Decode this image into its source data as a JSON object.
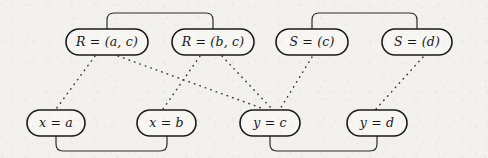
{
  "figure": {
    "kind": "constraint-graph-diagram",
    "background_color": "#f2f1ed",
    "ink_color": "#1a1a1c",
    "width": 488,
    "height": 158
  },
  "nodes": {
    "top_row": [
      {
        "id": "r-ac",
        "label": "R = (a, c)",
        "x": 66,
        "y": 29,
        "w": 82,
        "h": 26
      },
      {
        "id": "r-bc",
        "label": "R = (b, c)",
        "x": 172,
        "y": 29,
        "w": 82,
        "h": 26
      },
      {
        "id": "s-c",
        "label": "S = (c)",
        "x": 276,
        "y": 29,
        "w": 72,
        "h": 26
      },
      {
        "id": "s-d",
        "label": "S = (d)",
        "x": 382,
        "y": 29,
        "w": 70,
        "h": 26
      }
    ],
    "bottom_row": [
      {
        "id": "x-a",
        "label": "x = a",
        "x": 27,
        "y": 110,
        "w": 58,
        "h": 26
      },
      {
        "id": "x-b",
        "label": "x = b",
        "x": 137,
        "y": 110,
        "w": 59,
        "h": 26
      },
      {
        "id": "y-c",
        "label": "y = c",
        "x": 240,
        "y": 110,
        "w": 60,
        "h": 26
      },
      {
        "id": "y-d",
        "label": "y = d",
        "x": 347,
        "y": 110,
        "w": 60,
        "h": 26
      }
    ]
  },
  "brackets": [
    {
      "id": "bracket-top-left",
      "from": "r-ac",
      "to": "r-bc",
      "orientation": "above",
      "x1": 107,
      "x2": 213,
      "y_node": 29,
      "y_peak": 13
    },
    {
      "id": "bracket-top-right",
      "from": "s-c",
      "to": "s-d",
      "orientation": "above",
      "x1": 312,
      "x2": 417,
      "y_node": 29,
      "y_peak": 13
    },
    {
      "id": "bracket-bottom-left",
      "from": "x-a",
      "to": "x-b",
      "orientation": "below",
      "x1": 56,
      "x2": 167,
      "y_node": 136,
      "y_peak": 151
    },
    {
      "id": "bracket-bottom-right",
      "from": "y-c",
      "to": "y-d",
      "orientation": "below",
      "x1": 270,
      "x2": 377,
      "y_node": 136,
      "y_peak": 151
    }
  ],
  "dotted_edges": [
    {
      "id": "edge-rac-xa",
      "from": "r-ac",
      "to": "x-a",
      "x1": 95,
      "y1": 56,
      "x2": 56,
      "y2": 109
    },
    {
      "id": "edge-rac-yc",
      "from": "r-ac",
      "to": "y-c",
      "x1": 118,
      "y1": 56,
      "x2": 264,
      "y2": 109
    },
    {
      "id": "edge-rbc-xb",
      "from": "r-bc",
      "to": "x-b",
      "x1": 200,
      "y1": 56,
      "x2": 163,
      "y2": 109
    },
    {
      "id": "edge-rbc-yc",
      "from": "r-bc",
      "to": "y-c",
      "x1": 222,
      "y1": 56,
      "x2": 272,
      "y2": 109
    },
    {
      "id": "edge-sc-yc",
      "from": "s-c",
      "to": "y-c",
      "x1": 312,
      "y1": 57,
      "x2": 280,
      "y2": 109
    },
    {
      "id": "edge-sd-yd",
      "from": "s-d",
      "to": "y-d",
      "x1": 423,
      "y1": 57,
      "x2": 376,
      "y2": 109
    }
  ]
}
